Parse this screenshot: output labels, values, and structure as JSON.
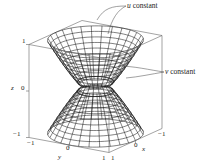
{
  "figure": {
    "type": "3d-surface-wireframe",
    "annotations": [
      {
        "id": "u",
        "var": "u",
        "text": " constant",
        "x": 127,
        "y": 8
      },
      {
        "id": "v",
        "var": "v",
        "text": " constant",
        "x": 165,
        "y": 74
      }
    ],
    "axes": {
      "z": {
        "label": "z",
        "ticks": [
          {
            "value": "1",
            "y": 41
          },
          {
            "value": "0",
            "y": 87
          },
          {
            "value": "−1",
            "y": 133
          }
        ]
      },
      "y": {
        "label": "y",
        "ticks": [
          "−1",
          "0",
          "1"
        ]
      },
      "x": {
        "label": "x",
        "ticks": [
          "1",
          "0",
          "−1"
        ]
      }
    },
    "labels": {
      "z_axis": "z",
      "y_axis": "y",
      "x_axis": "x",
      "z_top": "1",
      "z_mid": "0",
      "z_bot": "−1",
      "y_left": "−1",
      "y_mid": "0",
      "y_right": "1",
      "x_left": "1",
      "x_mid": "0",
      "x_right": "−1"
    },
    "colors": {
      "line": "#1a1a1a",
      "box": "#555555",
      "leader": "#444444"
    }
  }
}
